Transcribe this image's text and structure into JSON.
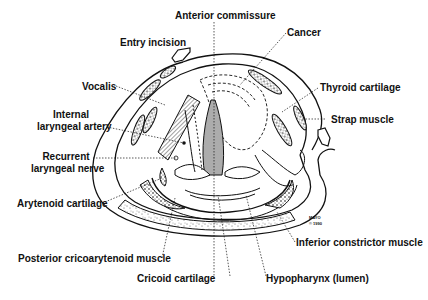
{
  "diagram": {
    "labels": {
      "anterior_commissure": "Anterior commissure",
      "entry_incision": "Entry incision",
      "cancer": "Cancer",
      "vocalis": "Vocalis",
      "thyroid_cartilage": "Thyroid cartilage",
      "internal_laryngeal_artery_1": "Internal",
      "internal_laryngeal_artery_2": "laryngeal artery",
      "strap_muscle": "Strap muscle",
      "recurrent_laryngeal_nerve_1": "Recurrent",
      "recurrent_laryngeal_nerve_2": "laryngeal nerve",
      "arytenoid_cartilage": "Arytenoid cartilage",
      "inferior_constrictor_muscle": "Inferior constrictor muscle",
      "posterior_cricoarytenoid_muscle": "Posterior cricoarytenoid muscle",
      "cricoid_cartilage": "Cricoid cartilage",
      "hypopharynx": "Hypopharynx (lumen)"
    },
    "mark": {
      "line1": "MAYO",
      "line2": "© 1990"
    },
    "colors": {
      "ink": "#111111",
      "background": "#ffffff"
    }
  }
}
